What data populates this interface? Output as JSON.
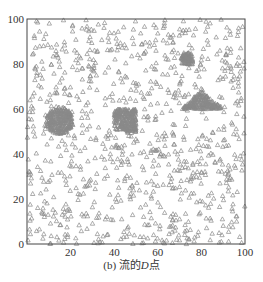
{
  "chart_data": {
    "type": "scatter",
    "title": "",
    "caption": "(b) 流的D点",
    "caption_parts": {
      "prefix": "(b) 流的",
      "italic": "D",
      "suffix": "点"
    },
    "xlabel": "",
    "ylabel": "",
    "xlim": [
      0,
      100
    ],
    "ylim": [
      0,
      100
    ],
    "xticks": [
      20,
      40,
      60,
      80,
      100
    ],
    "yticks": [
      0,
      20,
      40,
      60,
      80,
      100
    ],
    "grid": false,
    "legend": null,
    "marker": "triangle-open",
    "marker_color": "#8a8a8a",
    "series": [
      {
        "name": "uniform background points",
        "distribution": "uniform",
        "region": [
          0,
          100,
          0,
          100
        ],
        "count": 900
      },
      {
        "name": "circle cluster",
        "shape": "circle",
        "center": [
          15,
          55
        ],
        "radius": 6,
        "count": 260
      },
      {
        "name": "square cluster (large)",
        "shape": "rect",
        "x": [
          40,
          50
        ],
        "y": [
          50,
          60
        ],
        "count": 240
      },
      {
        "name": "square cluster (small)",
        "shape": "rect",
        "x": [
          71,
          76
        ],
        "y": [
          80,
          85
        ],
        "count": 90
      },
      {
        "name": "triangle cluster",
        "shape": "triangle",
        "vertices": [
          [
            70,
            60
          ],
          [
            90,
            60
          ],
          [
            80,
            68
          ]
        ],
        "count": 200
      }
    ]
  },
  "layout": {
    "plot": {
      "left": 27,
      "top": 19,
      "right": 245,
      "bottom": 244
    }
  }
}
